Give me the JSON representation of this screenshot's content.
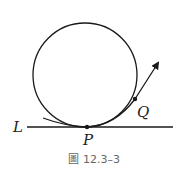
{
  "figure": {
    "labels": {
      "line": "L",
      "point_p": "P",
      "point_q": "Q"
    },
    "caption": {
      "prefix": "圖",
      "number": "12.3–3"
    },
    "colors": {
      "stroke": "#1a1a1a",
      "caption": "#666666"
    }
  }
}
